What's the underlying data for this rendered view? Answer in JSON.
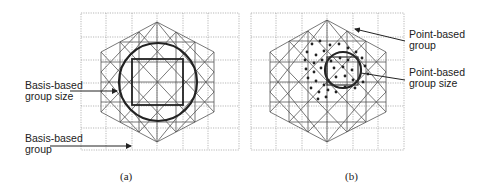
{
  "figure": {
    "panels": [
      {
        "id": "a",
        "caption": "(a)",
        "labels": [
          {
            "line1": "Basis-based",
            "line2": "group size"
          },
          {
            "line1": "Basis-based",
            "line2": "group"
          }
        ],
        "shapes": {
          "hexagon_mesh": true,
          "circle": "basis-based group size",
          "square": "inscribed"
        }
      },
      {
        "id": "b",
        "caption": "(b)",
        "labels": [
          {
            "line1": "Point-based",
            "line2": "group"
          },
          {
            "line1": "Point-based",
            "line2": "group size"
          }
        ],
        "shapes": {
          "hexagon_mesh": true,
          "circle": "point-based group size",
          "points": "scattered dots"
        }
      }
    ],
    "colors": {
      "grid": "#888888",
      "mesh": "#444444",
      "emphasis": "#222222"
    }
  }
}
